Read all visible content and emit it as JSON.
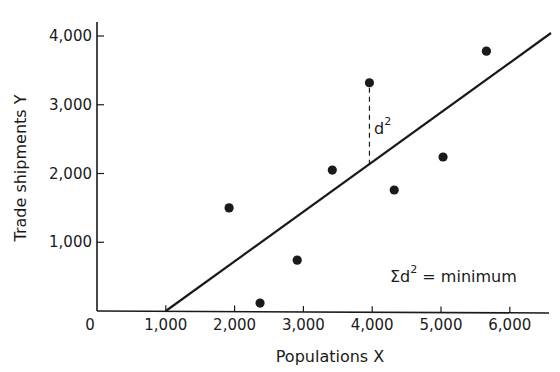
{
  "chart_data": {
    "type": "scatter",
    "title": "",
    "xlabel": "Populations X",
    "ylabel": "Trade shipments Y",
    "xlim": [
      0,
      6600
    ],
    "ylim": [
      0,
      4000
    ],
    "grid": false,
    "legend": null,
    "x_ticks": [
      0,
      1000,
      2000,
      3000,
      4000,
      5000,
      6000
    ],
    "x_tick_labels": [
      "0",
      "1,000",
      "2,000",
      "3,000",
      "4,000",
      "5,000",
      "6,000"
    ],
    "y_ticks": [
      1000,
      2000,
      3000,
      4000
    ],
    "y_tick_labels": [
      "1,000",
      "2,000",
      "3,000",
      "4,000"
    ],
    "origin_label": "0",
    "series": [
      {
        "name": "observations",
        "points": [
          {
            "x": 1920,
            "y": 1500
          },
          {
            "x": 2370,
            "y": 115
          },
          {
            "x": 2910,
            "y": 740
          },
          {
            "x": 3420,
            "y": 2050
          },
          {
            "x": 3960,
            "y": 3320
          },
          {
            "x": 4320,
            "y": 1760
          },
          {
            "x": 5030,
            "y": 2240
          },
          {
            "x": 5660,
            "y": 3780
          }
        ]
      }
    ],
    "regression_line": {
      "name": "least-squares line",
      "from": {
        "x": 1000,
        "y": 0
      },
      "to": {
        "x": 6600,
        "y": 4050
      }
    },
    "annotations": [
      {
        "text": "d",
        "superscript": "2",
        "type": "residual",
        "at_point_index": 4,
        "style": "dashed vertical"
      },
      {
        "text": "Σd",
        "superscript": "2",
        "suffix": " = minimum",
        "position": "lower-right"
      }
    ]
  },
  "labels": {
    "x_axis_title": "Populations X",
    "y_axis_title": "Trade shipments Y",
    "origin": "0",
    "residual_d": "d",
    "residual_sup": "2",
    "sum_sigma_d": "Σd",
    "sum_sup": "2",
    "sum_rest": " = minimum"
  },
  "colors": {
    "ink": "#1a1a1a",
    "background": "#ffffff"
  }
}
